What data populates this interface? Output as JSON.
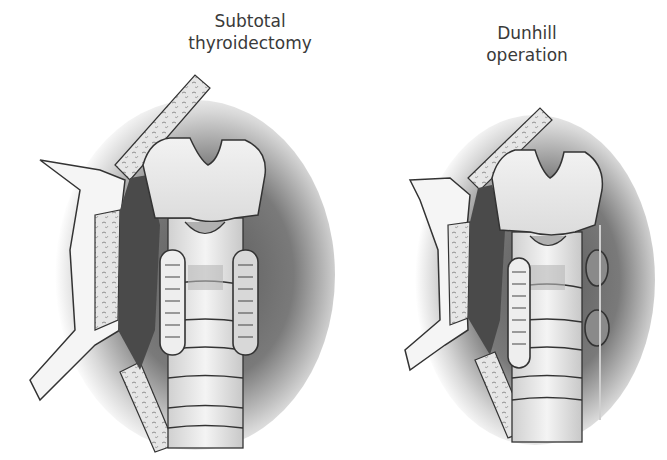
{
  "figure": {
    "panels": [
      {
        "title_line1": "Subtotal",
        "title_line2": "thyroidectomy"
      },
      {
        "title_line1": "Dunhill",
        "title_line2": "operation"
      }
    ]
  },
  "colors": {
    "outline": "#333333",
    "cartilage": "#e8e8e8",
    "shadow": "#4a4a4a",
    "bone_fill": "#dcdcdc"
  }
}
